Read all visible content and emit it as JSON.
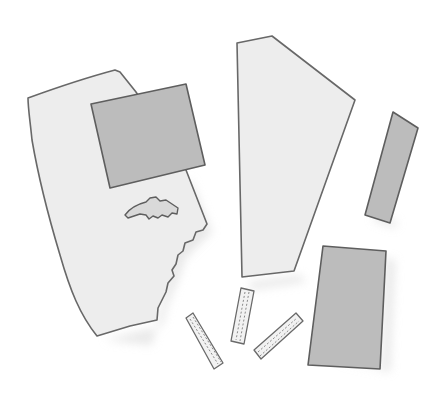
{
  "scene": {
    "description": "Hand-drawn grayscale illustration of cut-out paper and fabric pieces scattered on a white background",
    "background": "#ffffff",
    "colors": {
      "light_fill": "#ededed",
      "dark_fill": "#bcbcbc",
      "outline": "#686868",
      "shadow": "#d6d6d6",
      "hole_fill": "#d9d9d9"
    },
    "pieces": [
      {
        "id": "large-light-piece-with-torn-edge",
        "shade": "light"
      },
      {
        "id": "dark-rectangle-on-large-piece",
        "shade": "dark"
      },
      {
        "id": "irregular-hole-cutout",
        "shade": "hole"
      },
      {
        "id": "tall-light-polygon-piece",
        "shade": "light"
      },
      {
        "id": "narrow-dark-strip",
        "shade": "dark"
      },
      {
        "id": "dark-rectangle-bottom-right",
        "shade": "dark"
      },
      {
        "id": "small-stitched-strip-1",
        "shade": "light"
      },
      {
        "id": "small-stitched-strip-2",
        "shade": "light"
      },
      {
        "id": "small-stitched-strip-3",
        "shade": "light"
      }
    ]
  }
}
